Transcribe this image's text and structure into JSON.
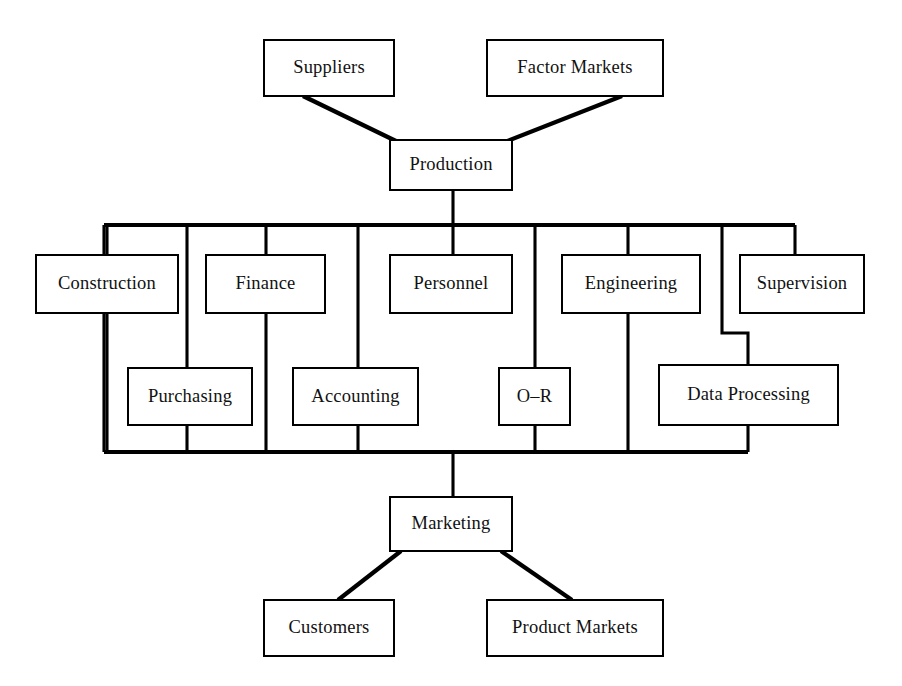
{
  "diagram": {
    "type": "block-flow-chart",
    "background_color": "#ffffff",
    "line_color": "#000000",
    "text_color": "#111111",
    "canvas": {
      "width": 902,
      "height": 686
    },
    "nodes": [
      {
        "id": "suppliers",
        "label": "Suppliers",
        "x": 264,
        "y": 40,
        "w": 130,
        "h": 56,
        "row": "top-sources"
      },
      {
        "id": "factor_markets",
        "label": "Factor Markets",
        "x": 487,
        "y": 40,
        "w": 176,
        "h": 56,
        "row": "top-sources"
      },
      {
        "id": "production",
        "label": "Production",
        "x": 390,
        "y": 140,
        "w": 122,
        "h": 50,
        "row": "hub-top"
      },
      {
        "id": "construction",
        "label": "Construction",
        "x": 36,
        "y": 255,
        "w": 142,
        "h": 58,
        "row": "bus-upper"
      },
      {
        "id": "finance",
        "label": "Finance",
        "x": 206,
        "y": 255,
        "w": 119,
        "h": 58,
        "row": "bus-upper"
      },
      {
        "id": "personnel",
        "label": "Personnel",
        "x": 390,
        "y": 255,
        "w": 122,
        "h": 58,
        "row": "bus-upper"
      },
      {
        "id": "engineering",
        "label": "Engineering",
        "x": 562,
        "y": 255,
        "w": 138,
        "h": 58,
        "row": "bus-upper"
      },
      {
        "id": "supervision",
        "label": "Supervision",
        "x": 740,
        "y": 255,
        "w": 124,
        "h": 58,
        "row": "bus-upper"
      },
      {
        "id": "purchasing",
        "label": "Purchasing",
        "x": 128,
        "y": 368,
        "w": 124,
        "h": 57,
        "row": "bus-lower"
      },
      {
        "id": "accounting",
        "label": "Accounting",
        "x": 293,
        "y": 368,
        "w": 125,
        "h": 57,
        "row": "bus-lower"
      },
      {
        "id": "o_r",
        "label": "O–R",
        "x": 499,
        "y": 368,
        "w": 71,
        "h": 57,
        "row": "bus-lower"
      },
      {
        "id": "data_processing",
        "label": "Data Processing",
        "x": 659,
        "y": 365,
        "w": 179,
        "h": 60,
        "row": "bus-lower"
      },
      {
        "id": "marketing",
        "label": "Marketing",
        "x": 390,
        "y": 497,
        "w": 122,
        "h": 54,
        "row": "hub-bottom"
      },
      {
        "id": "customers",
        "label": "Customers",
        "x": 264,
        "y": 600,
        "w": 130,
        "h": 56,
        "row": "bottom-sinks"
      },
      {
        "id": "product_markets",
        "label": "Product Markets",
        "x": 487,
        "y": 600,
        "w": 176,
        "h": 56,
        "row": "bottom-sinks"
      }
    ],
    "bus": {
      "top_y": 225,
      "bottom_y": 452,
      "left_x": 104,
      "right_x_top": 795,
      "right_x_bottom": 748
    },
    "connections": [
      {
        "id": "suppliers-production",
        "from": "suppliers",
        "to": "production",
        "style": "diagonal"
      },
      {
        "id": "factor-markets-production",
        "from": "factor_markets",
        "to": "production",
        "style": "diagonal"
      },
      {
        "id": "production-bus",
        "from": "production",
        "to": "bus-top",
        "style": "vertical"
      },
      {
        "id": "bus-construction",
        "from": "bus-top",
        "to": "construction",
        "style": "orthogonal"
      },
      {
        "id": "bus-finance",
        "from": "bus-top",
        "to": "finance",
        "style": "vertical"
      },
      {
        "id": "bus-personnel",
        "from": "bus-top",
        "to": "personnel",
        "style": "vertical"
      },
      {
        "id": "bus-engineering",
        "from": "bus-top",
        "to": "engineering",
        "style": "vertical"
      },
      {
        "id": "bus-supervision",
        "from": "bus-top",
        "to": "supervision",
        "style": "orthogonal"
      },
      {
        "id": "bus-purchasing",
        "from": "bus-top",
        "to": "purchasing",
        "style": "vertical"
      },
      {
        "id": "bus-accounting",
        "from": "bus-top",
        "to": "accounting",
        "style": "vertical"
      },
      {
        "id": "bus-o-r",
        "from": "bus-top",
        "to": "o_r",
        "style": "vertical"
      },
      {
        "id": "bus-data-processing",
        "from": "bus-top",
        "to": "data_processing",
        "style": "orthogonal-jog"
      },
      {
        "id": "bus-marketing",
        "from": "bus-bottom",
        "to": "marketing",
        "style": "vertical"
      },
      {
        "id": "marketing-customers",
        "from": "marketing",
        "to": "customers",
        "style": "diagonal"
      },
      {
        "id": "marketing-product-markets",
        "from": "marketing",
        "to": "product_markets",
        "style": "diagonal"
      }
    ],
    "paths": [
      {
        "id": "suppliers-to-production",
        "name": "link-suppliers-production",
        "kind": "diagonal",
        "d": "M 303 96 L 398 142"
      },
      {
        "id": "factor-markets-to-production",
        "name": "link-factor-markets-production",
        "kind": "diagonal",
        "d": "M 622 96 L 505 142"
      },
      {
        "id": "production-to-bus",
        "name": "link-production-bus",
        "kind": "line",
        "d": "M 453 190 L 453 225"
      },
      {
        "id": "bus-top-rail",
        "name": "bus-rail-top",
        "kind": "rail",
        "d": "M 104 225 L 795 225"
      },
      {
        "id": "bus-bottom-rail",
        "name": "bus-rail-bottom",
        "kind": "rail",
        "d": "M 104 452 L 748 452"
      },
      {
        "id": "drop-construction-left",
        "name": "link-bus-construction",
        "kind": "line",
        "d": "M 104 225 L 104 452"
      },
      {
        "id": "drop-construction-center",
        "name": "link-construction-column",
        "kind": "line",
        "d": "M 107 225 L 107 255"
      },
      {
        "id": "drop-construction-stem",
        "name": "link-construction-stem",
        "kind": "line",
        "d": "M 107 313 L 107 452"
      },
      {
        "id": "drop-purchasing",
        "name": "link-bus-purchasing",
        "kind": "line",
        "d": "M 187 225 L 187 368"
      },
      {
        "id": "stem-purchasing",
        "name": "link-purchasing-bus",
        "kind": "line",
        "d": "M 187 425 L 187 452"
      },
      {
        "id": "drop-finance",
        "name": "link-bus-finance",
        "kind": "line",
        "d": "M 266 225 L 266 255"
      },
      {
        "id": "stem-finance",
        "name": "link-finance-bus",
        "kind": "line",
        "d": "M 266 313 L 266 452"
      },
      {
        "id": "drop-accounting",
        "name": "link-bus-accounting",
        "kind": "line",
        "d": "M 358 225 L 358 368"
      },
      {
        "id": "stem-accounting",
        "name": "link-accounting-bus",
        "kind": "line",
        "d": "M 358 425 L 358 452"
      },
      {
        "id": "drop-personnel",
        "name": "link-bus-personnel",
        "kind": "line",
        "d": "M 453 225 L 453 255"
      },
      {
        "id": "drop-o-r",
        "name": "link-bus-o-r",
        "kind": "line",
        "d": "M 535 225 L 535 368"
      },
      {
        "id": "stem-o-r",
        "name": "link-o-r-bus",
        "kind": "line",
        "d": "M 535 425 L 535 452"
      },
      {
        "id": "drop-engineering",
        "name": "link-bus-engineering",
        "kind": "line",
        "d": "M 628 225 L 628 255"
      },
      {
        "id": "stem-engineering",
        "name": "link-engineering-bus",
        "kind": "line",
        "d": "M 628 313 L 628 452"
      },
      {
        "id": "drop-data-processing",
        "name": "link-bus-data-processing",
        "kind": "jog",
        "d": "M 722 225 L 722 333 L 748 333 L 748 365"
      },
      {
        "id": "stem-data-processing",
        "name": "link-data-processing-bus",
        "kind": "line",
        "d": "M 748 425 L 748 452"
      },
      {
        "id": "drop-supervision",
        "name": "link-bus-supervision",
        "kind": "jog",
        "d": "M 795 225 L 795 255"
      },
      {
        "id": "bus-to-marketing",
        "name": "link-bus-marketing",
        "kind": "line",
        "d": "M 453 452 L 453 497"
      },
      {
        "id": "marketing-to-customers",
        "name": "link-marketing-customers",
        "kind": "diagonal",
        "d": "M 401 551 L 338 600"
      },
      {
        "id": "marketing-to-product-markets",
        "name": "link-marketing-product-markets",
        "kind": "diagonal",
        "d": "M 501 551 L 572 600"
      }
    ]
  }
}
